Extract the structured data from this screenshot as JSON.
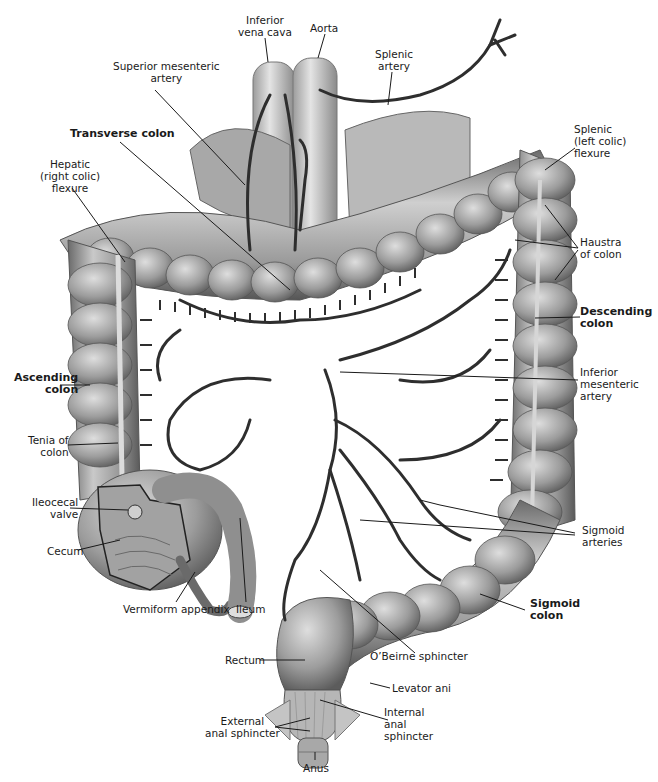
{
  "figure": {
    "colors": {
      "background": "#ffffff",
      "colon_fill": "#9a9a9a",
      "colon_light": "#cfcfcf",
      "colon_dark": "#555555",
      "vessel": "#2e2e2e",
      "vena_cava": "#bdbdbd",
      "leader_line": "#1a1a1a",
      "text": "#1a1a1a"
    }
  },
  "labels": {
    "inferior_vena_cava": "Inferior\nvena cava",
    "aorta": "Aorta",
    "superior_mesenteric_artery": "Superior mesenteric\nartery",
    "splenic_artery": "Splenic\nartery",
    "transverse_colon": "Transverse colon",
    "splenic_flexure": "Splenic\n(left colic)\nflexure",
    "hepatic_flexure": "Hepatic\n(right colic)\nflexure",
    "haustra_of_colon": "Haustra\nof colon",
    "descending_colon": "Descending\ncolon",
    "ascending_colon": "Ascending\ncolon",
    "inferior_mesenteric_artery": "Inferior\nmesenteric\nartery",
    "tenia_of_colon": "Tenia of\ncolon",
    "ileocecal_valve": "Ileocecal\nvalve",
    "cecum": "Cecum",
    "sigmoid_arteries": "Sigmoid\narteries",
    "vermiform_appendix": "Vermiform appendix",
    "ileum": "Ileum",
    "sigmoid_colon": "Sigmoid\ncolon",
    "obeirne_sphincter": "O’Beirne sphincter",
    "rectum": "Rectum",
    "levator_ani": "Levator ani",
    "external_anal_sphincter": "External\nanal sphincter",
    "internal_anal_sphincter": "Internal\nanal\nsphincter",
    "anus": "Anus"
  }
}
